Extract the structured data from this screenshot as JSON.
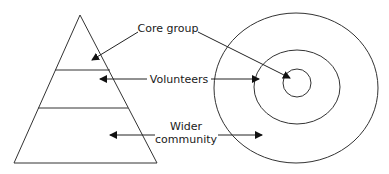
{
  "diagram": {
    "labels": {
      "core": "Core group",
      "volunteers": "Volunteers",
      "wider_line1": "Wider",
      "wider_line2": "community"
    },
    "shapes": {
      "pyramid": {
        "levels": 3
      },
      "concentric_circles": {
        "rings": 3
      }
    },
    "colors": {
      "stroke": "#333333",
      "text": "#1a1a1a",
      "background": "#ffffff"
    }
  }
}
